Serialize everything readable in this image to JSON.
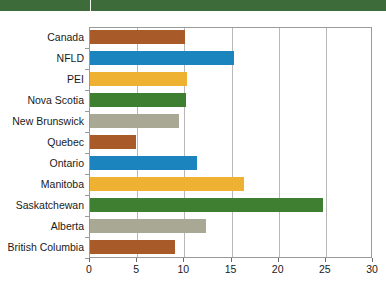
{
  "banner": {
    "name": "top-green-band",
    "color": "#3e6b3a",
    "tick_color": "#f2f6f1"
  },
  "chart_data": {
    "type": "bar",
    "orientation": "horizontal",
    "title": "",
    "subtitle": "",
    "xlabel": "",
    "ylabel": "",
    "xlim": [
      0,
      30
    ],
    "ylim": null,
    "grid": true,
    "legend": null,
    "xticks": [
      0,
      5,
      10,
      15,
      20,
      25,
      30
    ],
    "xtick_labels": [
      "0",
      "5",
      "10",
      "15",
      "20",
      "25",
      "30"
    ],
    "categories": [
      "Canada",
      "NFLD",
      "PEI",
      "Nova Scotia",
      "New Brunswick",
      "Quebec",
      "Ontario",
      "Manitoba",
      "Saskatchewan",
      "Alberta",
      "British Columbia"
    ],
    "values": [
      10.1,
      15.3,
      10.3,
      10.2,
      9.4,
      4.9,
      11.3,
      16.3,
      24.7,
      12.3,
      9.0
    ],
    "bar_colors": [
      "#a85a28",
      "#1b83bd",
      "#efb132",
      "#3f7f32",
      "#a8a895",
      "#a85a28",
      "#1b83bd",
      "#efb132",
      "#3f7f32",
      "#a8a895",
      "#a85a28"
    ],
    "palette": {
      "rust": "#a85a28",
      "blue": "#1b83bd",
      "gold": "#efb132",
      "green": "#3f7f32",
      "gray": "#a8a895"
    },
    "axis_color": "#9a9a9a",
    "gridline_color": "#b8b8b8"
  }
}
